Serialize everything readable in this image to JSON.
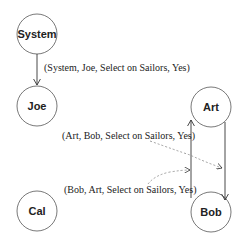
{
  "nodes": [
    {
      "id": "system",
      "label": "System"
    },
    {
      "id": "joe",
      "label": "Joe"
    },
    {
      "id": "cal",
      "label": "Cal"
    },
    {
      "id": "art",
      "label": "Art"
    },
    {
      "id": "bob",
      "label": "Bob"
    }
  ],
  "edges": [
    {
      "from": "System",
      "to": "Joe",
      "label": "(System, Joe, Select on Sailors, Yes)",
      "style": "solid"
    },
    {
      "from": "Art",
      "to": "Bob",
      "label": "(Art, Bob, Select on Sailors, Yes)",
      "style": "solid"
    },
    {
      "from": "Bob",
      "to": "Art",
      "label": "(Bob, Art, Select on Sailors, Yes)",
      "style": "solid"
    }
  ],
  "colors": {
    "stroke": "#333333",
    "dashed": "#888888"
  }
}
